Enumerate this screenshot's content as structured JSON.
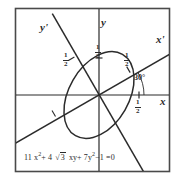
{
  "figure": {
    "equation": {
      "full_text": "11 x² + 4 √3 xy + 7 y² − 1 = 0",
      "lead_coefficient": "11",
      "x_squared_base": "x",
      "x_squared_exp": "2",
      "plus_1": "+",
      "xy_coefficient": "4",
      "radical_sign": "√",
      "radicand": "3",
      "xy_term": "xy",
      "plus_2": "+",
      "y_squared_coefficient": "7",
      "y_squared_base": "y",
      "y_squared_exp": "2",
      "minus": "−",
      "constant": "1",
      "equals": "=",
      "right_hand_side": "0"
    },
    "axis_labels": [
      {
        "name": "y-prime-axis-label",
        "text": "y'",
        "x": 40,
        "y": 22
      },
      {
        "name": "y-axis-label",
        "text": "y",
        "x": 101,
        "y": 17
      },
      {
        "name": "x-prime-axis-label",
        "text": "x'",
        "x": 156,
        "y": 34
      },
      {
        "name": "x-axis-label",
        "text": "x",
        "x": 160,
        "y": 96
      }
    ],
    "angle": {
      "label": "30°",
      "value_degrees": 30,
      "x": 134,
      "y": 74
    },
    "tick_labels": [
      {
        "name": "tick-half-y-prime",
        "numerator": "1",
        "denominator": "2",
        "x": 63,
        "y": 54,
        "axis": "y'"
      },
      {
        "name": "tick-half-y",
        "numerator": "1",
        "denominator": "2",
        "x": 95,
        "y": 46,
        "axis": "y"
      },
      {
        "name": "tick-half-x-prime",
        "numerator": "1",
        "denominator": "2",
        "x": 124,
        "y": 54,
        "axis": "x'"
      },
      {
        "name": "tick-half-x",
        "numerator": "1",
        "denominator": "2",
        "x": 136,
        "y": 100,
        "axis": "x"
      }
    ],
    "colors": {
      "ink": "#2b2b2b",
      "frame": "#4a4a4a",
      "background": "#ffffff"
    },
    "geometry": {
      "frame": {
        "x": 15,
        "y": 8,
        "width": 155,
        "height": 164
      },
      "origin": {
        "x": 99,
        "y": 95
      },
      "rotation_degrees": 30,
      "ellipse": {
        "center_x": 99,
        "center_y": 95,
        "semi_major": 47,
        "semi_minor": 30,
        "tilt_degrees": -60
      }
    }
  }
}
